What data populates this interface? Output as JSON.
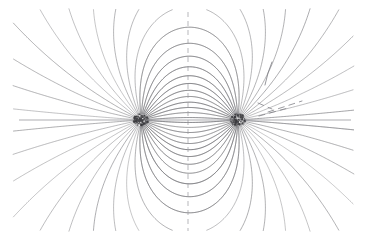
{
  "figure": {
    "kind": "field-line-diagram",
    "width": 367,
    "height": 241,
    "background_color": "#ffffff",
    "line_color": "#6e6e72",
    "axis_color": "#9a9a9f",
    "charge_color": "#3a3a3e"
  },
  "chart_data": {
    "type": "line",
    "xlabel": "",
    "ylabel": "",
    "grid": false,
    "legend": null,
    "xlim": [
      0,
      367
    ],
    "ylim": [
      0,
      241
    ],
    "charges": [
      {
        "name": "left-charge",
        "x": 141,
        "y": 120,
        "sign": 1,
        "magnitude": 1
      },
      {
        "name": "right-charge",
        "x": 238,
        "y": 120,
        "sign": -1,
        "magnitude": 1
      }
    ],
    "separation_px": 97,
    "midpoint_x": 188,
    "axis_y": 120,
    "field_line_count": 44,
    "start_radius_px": 6.5,
    "step_px": 1.5,
    "max_steps": 900,
    "bounds": {
      "x_min": 14,
      "x_max": 353,
      "y_min": 10,
      "y_max": 230
    },
    "axis_horizontal": {
      "x1": 19,
      "x2": 351,
      "y": 120
    },
    "axis_vertical": {
      "x": 188,
      "y1": 12,
      "y2": 231
    },
    "vertical_axis_dash": [
      5,
      4
    ],
    "artifacts": [
      {
        "name": "stray-stroke",
        "points": [
          [
            272,
            62
          ],
          [
            268,
            73
          ],
          [
            265,
            85
          ]
        ],
        "dashed": false
      },
      {
        "name": "stray-dash-upper",
        "points": [
          [
            258,
            103
          ],
          [
            272,
            109
          ]
        ],
        "dashed": true
      },
      {
        "name": "stray-dash-lower",
        "points": [
          [
            268,
            112
          ],
          [
            302,
            101
          ]
        ],
        "dashed": true
      },
      {
        "name": "stray-dash-tail",
        "points": [
          [
            259,
            116
          ],
          [
            288,
            108
          ]
        ],
        "dashed": true
      }
    ]
  },
  "labels": {
    "page_title": "Electric Dipole Field Lines",
    "caption": ""
  }
}
